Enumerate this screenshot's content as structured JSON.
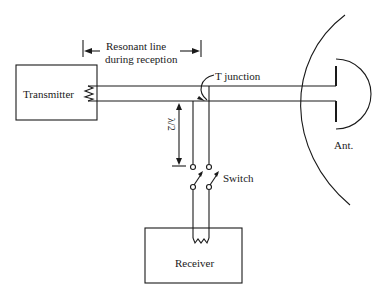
{
  "diagram": {
    "type": "schematic",
    "labels": {
      "transmitter": "Transmitter",
      "receiver": "Receiver",
      "resonant_line_1": "Resonant line",
      "resonant_line_2": "during reception",
      "t_junction": "T junction",
      "lambda_num": "λ",
      "lambda_den": "2",
      "switch": "Switch",
      "antenna": "Ant."
    },
    "colors": {
      "stroke": "#1a1a1a",
      "background": "#ffffff"
    }
  }
}
